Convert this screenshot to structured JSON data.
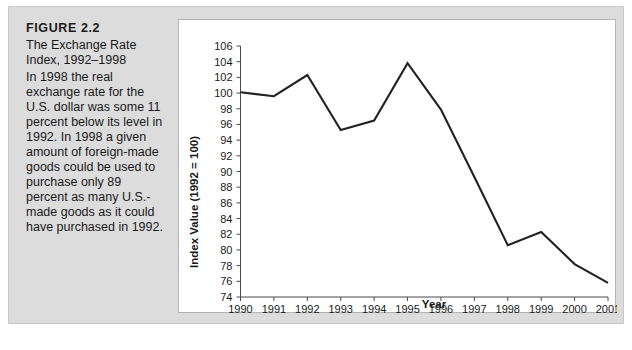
{
  "figure": {
    "number": "FIGURE 2.2",
    "title": "The Exchange Rate Index, 1992–1998",
    "body": "In 1998 the real exchange rate for the U.S. dollar was some 11 percent below its level in 1992. In 1998 a given amount of foreign-made goods could be used to purchase only 89 percent as many U.S.-made goods as it could have purchased in 1992."
  },
  "chart_data": {
    "type": "line",
    "title": "",
    "xlabel": "Year",
    "ylabel": "Index Value (1992 = 100)",
    "categories": [
      "1990",
      "1991",
      "1992",
      "1993",
      "1994",
      "1995",
      "1996",
      "1997",
      "1998",
      "1999",
      "2000",
      "2001"
    ],
    "x": [
      1990,
      1991,
      1992,
      1993,
      1994,
      1995,
      1996,
      1997,
      1998,
      1999,
      2000,
      2001
    ],
    "values": [
      100.1,
      99.6,
      102.3,
      95.3,
      96.5,
      103.8,
      97.9,
      89.3,
      80.6,
      82.3,
      78.2,
      75.8
    ],
    "series": [
      {
        "name": "Exchange Rate Index",
        "values": [
          100.1,
          99.6,
          102.3,
          95.3,
          96.5,
          103.8,
          97.9,
          89.3,
          80.6,
          82.3,
          78.2,
          75.8
        ]
      }
    ],
    "ylim": [
      74,
      106
    ],
    "ytick_step": 2,
    "yticks": [
      74,
      76,
      78,
      80,
      82,
      84,
      86,
      88,
      90,
      92,
      94,
      96,
      98,
      100,
      102,
      104,
      106
    ],
    "xlim": [
      1990,
      2001
    ],
    "grid": false,
    "legend": false,
    "line_color": "#222222"
  },
  "colors": {
    "panel_background": "#dcdcdc",
    "chart_background": "#ffffff",
    "text": "#1a1a1a",
    "axis": "#4a4a4a"
  }
}
